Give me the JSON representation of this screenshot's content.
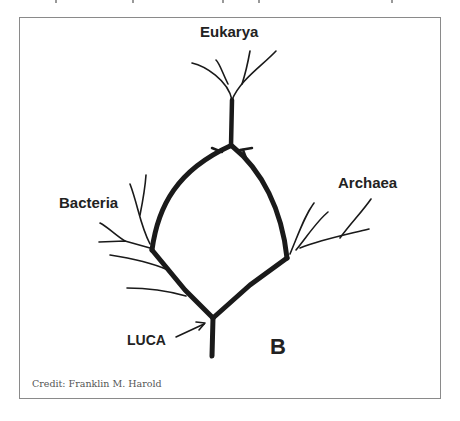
{
  "figure": {
    "panel_letter": "B",
    "labels": {
      "eukarya": "Eukarya",
      "bacteria": "Bacteria",
      "archaea": "Archaea",
      "luca": "LUCA"
    },
    "credit": "Credit: Franklin M. Harold"
  },
  "colors": {
    "stroke": "#1a1a1a",
    "frame": "#8a8a8a",
    "text": "#222222",
    "credit": "#555555"
  }
}
